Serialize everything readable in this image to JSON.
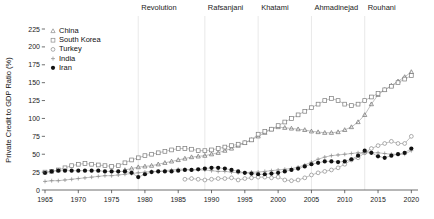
{
  "chart_data": {
    "type": "line",
    "title": "",
    "xlabel": "",
    "ylabel": "Private Credit to GDP Ratio (%)",
    "xlim": [
      1965,
      2021
    ],
    "ylim": [
      0,
      232
    ],
    "yticks": [
      0,
      25,
      50,
      75,
      100,
      125,
      150,
      175,
      200,
      225
    ],
    "xticks": [
      1965,
      1970,
      1975,
      1980,
      1985,
      1990,
      1995,
      2000,
      2005,
      2010,
      2015,
      2020
    ],
    "grid": "vertical-era-only",
    "legend_position": "top-left",
    "annotations": [
      {
        "label": "Revolution",
        "x": 1979
      },
      {
        "label": "Rafsanjani",
        "x": 1989
      },
      {
        "label": "Khatami",
        "x": 1997
      },
      {
        "label": "Ahmadinejad",
        "x": 2005
      },
      {
        "label": "Rouhani",
        "x": 2013
      }
    ],
    "series": [
      {
        "name": "China",
        "marker": "triangle",
        "color": "#6e6e6e",
        "x": [
          1977,
          1978,
          1979,
          1980,
          1981,
          1982,
          1983,
          1984,
          1985,
          1986,
          1987,
          1988,
          1989,
          1990,
          1991,
          1992,
          1993,
          1994,
          1995,
          1996,
          1997,
          1998,
          1999,
          2000,
          2001,
          2002,
          2003,
          2004,
          2005,
          2006,
          2007,
          2008,
          2009,
          2010,
          2011,
          2012,
          2013,
          2014,
          2015,
          2016,
          2017,
          2018,
          2019,
          2020
        ],
        "values": [
          28,
          30,
          32,
          33,
          34,
          36,
          38,
          40,
          42,
          44,
          46,
          47,
          48,
          50,
          52,
          55,
          58,
          62,
          66,
          70,
          75,
          80,
          85,
          88,
          87,
          86,
          85,
          84,
          82,
          81,
          80,
          80,
          81,
          84,
          88,
          95,
          105,
          120,
          133,
          140,
          146,
          152,
          158,
          165
        ]
      },
      {
        "name": "South Korea",
        "marker": "square",
        "color": "#7a7a7a",
        "x": [
          1965,
          1966,
          1967,
          1968,
          1969,
          1970,
          1971,
          1972,
          1973,
          1974,
          1975,
          1976,
          1977,
          1978,
          1979,
          1980,
          1981,
          1982,
          1983,
          1984,
          1985,
          1986,
          1987,
          1988,
          1989,
          1990,
          1991,
          1992,
          1993,
          1994,
          1995,
          1996,
          1997,
          1998,
          1999,
          2000,
          2001,
          2002,
          2003,
          2004,
          2005,
          2006,
          2007,
          2008,
          2009,
          2010,
          2011,
          2012,
          2013,
          2014,
          2015,
          2016,
          2017,
          2018,
          2019,
          2020
        ],
        "values": [
          25,
          26,
          28,
          31,
          34,
          36,
          37,
          36,
          35,
          34,
          33,
          34,
          38,
          42,
          45,
          48,
          50,
          52,
          54,
          56,
          58,
          58,
          57,
          55,
          55,
          56,
          58,
          60,
          62,
          64,
          66,
          70,
          78,
          82,
          85,
          90,
          95,
          100,
          105,
          110,
          115,
          120,
          125,
          128,
          125,
          120,
          118,
          120,
          125,
          130,
          135,
          140,
          145,
          150,
          155,
          160
        ]
      },
      {
        "name": "Turkey",
        "marker": "circle-open",
        "color": "#8a8a8a",
        "x": [
          1986,
          1987,
          1988,
          1989,
          1990,
          1991,
          1992,
          1993,
          1994,
          1995,
          1996,
          1997,
          1998,
          1999,
          2000,
          2001,
          2002,
          2003,
          2004,
          2005,
          2006,
          2007,
          2008,
          2009,
          2010,
          2011,
          2012,
          2013,
          2014,
          2015,
          2016,
          2017,
          2018,
          2019,
          2020
        ],
        "values": [
          15,
          16,
          15,
          14,
          15,
          16,
          16,
          17,
          14,
          16,
          17,
          18,
          18,
          17,
          18,
          14,
          13,
          14,
          17,
          21,
          24,
          26,
          28,
          31,
          36,
          42,
          45,
          52,
          58,
          62,
          65,
          68,
          65,
          65,
          75
        ]
      },
      {
        "name": "India",
        "marker": "plus",
        "color": "#8a8a8a",
        "x": [
          1965,
          1966,
          1967,
          1968,
          1969,
          1970,
          1971,
          1972,
          1973,
          1974,
          1975,
          1976,
          1977,
          1978,
          1979,
          1980,
          1981,
          1982,
          1983,
          1984,
          1985,
          1986,
          1987,
          1988,
          1989,
          1990,
          1991,
          1992,
          1993,
          1994,
          1995,
          1996,
          1997,
          1998,
          1999,
          2000,
          2001,
          2002,
          2003,
          2004,
          2005,
          2006,
          2007,
          2008,
          2009,
          2010,
          2011,
          2012,
          2013,
          2014,
          2015,
          2016,
          2017,
          2018,
          2019,
          2020
        ],
        "values": [
          12,
          13,
          13,
          14,
          15,
          16,
          17,
          18,
          19,
          20,
          20,
          21,
          22,
          23,
          24,
          25,
          26,
          26,
          27,
          28,
          29,
          29,
          28,
          28,
          28,
          27,
          26,
          26,
          25,
          24,
          24,
          25,
          25,
          26,
          27,
          28,
          29,
          30,
          32,
          35,
          39,
          43,
          46,
          48,
          49,
          50,
          51,
          52,
          52,
          52,
          52,
          51,
          50,
          50,
          50,
          55
        ]
      },
      {
        "name": "Iran",
        "marker": "circle-filled",
        "color": "#111111",
        "x": [
          1965,
          1966,
          1967,
          1968,
          1969,
          1970,
          1971,
          1972,
          1973,
          1974,
          1975,
          1976,
          1977,
          1978,
          1979,
          1980,
          1981,
          1982,
          1983,
          1984,
          1985,
          1986,
          1987,
          1988,
          1989,
          1990,
          1991,
          1992,
          1993,
          1994,
          1995,
          1996,
          1997,
          1998,
          1999,
          2000,
          2001,
          2002,
          2003,
          2004,
          2005,
          2006,
          2007,
          2008,
          2009,
          2010,
          2011,
          2012,
          2013,
          2014,
          2015,
          2016,
          2017,
          2018,
          2019,
          2020
        ],
        "values": [
          24,
          26,
          27,
          27,
          27,
          27,
          27,
          27,
          27,
          26,
          26,
          26,
          26,
          24,
          18,
          22,
          25,
          26,
          26,
          26,
          27,
          28,
          28,
          29,
          30,
          31,
          31,
          30,
          28,
          26,
          24,
          23,
          22,
          22,
          23,
          24,
          26,
          28,
          30,
          33,
          36,
          38,
          40,
          40,
          39,
          40,
          43,
          48,
          55,
          52,
          47,
          45,
          48,
          50,
          52,
          58
        ]
      }
    ]
  },
  "axis": {
    "y_title": "Private Credit to GDP Ratio (%)",
    "y_labels": [
      "225",
      "200",
      "175",
      "150",
      "125",
      "100",
      "75",
      "50",
      "25",
      "0"
    ],
    "x_labels": [
      "1965",
      "1970",
      "1975",
      "1980",
      "1985",
      "1990",
      "1995",
      "2000",
      "2005",
      "2010",
      "2015",
      "2020"
    ]
  },
  "legend": {
    "entries": [
      {
        "label": "China",
        "marker": "triangle"
      },
      {
        "label": "South Korea",
        "marker": "square"
      },
      {
        "label": "Turkey",
        "marker": "circle-open"
      },
      {
        "label": "India",
        "marker": "plus"
      },
      {
        "label": "Iran",
        "marker": "circle-filled"
      }
    ]
  },
  "eras": {
    "labels": [
      "Revolution",
      "Rafsanjani",
      "Khatami",
      "Ahmadinejad",
      "Rouhani"
    ]
  }
}
